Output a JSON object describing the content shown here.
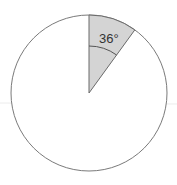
{
  "diagram": {
    "type": "circle-sector",
    "sector_angle_label": "36°",
    "sector_angle_degrees": 36,
    "colors": {
      "circle_stroke": "#7a7a7a",
      "sector_fill": "#d4d4d4",
      "background": "#ffffff"
    }
  }
}
